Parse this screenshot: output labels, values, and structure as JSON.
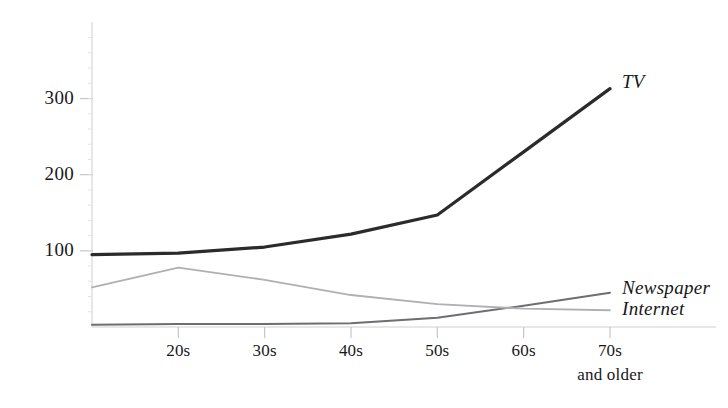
{
  "chart_data": {
    "type": "line",
    "title": "",
    "subtitle": "",
    "xlabel": "",
    "ylabel": "",
    "categories": [
      "",
      "20s",
      "30s",
      "40s",
      "50s",
      "60s",
      "70s"
    ],
    "x_tick_sublabels": [
      "",
      "",
      "",
      "",
      "",
      "",
      "and older"
    ],
    "y_ticks": [
      100,
      200,
      300
    ],
    "ylim": [
      0,
      390
    ],
    "grid": false,
    "legend_position": "line-end-labels",
    "series": [
      {
        "name": "TV",
        "color": "#2b2b2e",
        "width": 3.2,
        "values": [
          95,
          97,
          105,
          122,
          147,
          230,
          313
        ]
      },
      {
        "name": "Newspaper",
        "color": "#6e6e72",
        "width": 2.0,
        "values": [
          3,
          4,
          4,
          5,
          12,
          28,
          45
        ]
      },
      {
        "name": "Internet",
        "color": "#b0b0b3",
        "width": 1.8,
        "values": [
          52,
          78,
          62,
          42,
          30,
          24,
          22
        ]
      }
    ],
    "axis_color": "#cfcfd2",
    "tick_color": "#c6c6c9",
    "background": "#ffffff"
  },
  "labels": {
    "y": [
      "300",
      "200",
      "100"
    ],
    "x": [
      "20s",
      "30s",
      "40s",
      "50s",
      "60s",
      "70s"
    ],
    "x_sub": "and older",
    "series": {
      "tv": "TV",
      "newspaper": "Newspaper",
      "internet": "Internet"
    }
  }
}
